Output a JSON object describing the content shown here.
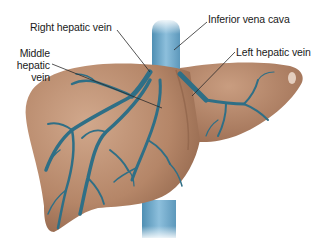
{
  "diagram": {
    "labels": [
      {
        "id": "right-hepatic-vein",
        "text": "Right hepatic vein"
      },
      {
        "id": "inferior-vena-cava",
        "text": "Inferior vena cava"
      },
      {
        "id": "middle-hepatic-vein",
        "lines": [
          "Middle",
          "hepatic",
          "vein"
        ]
      },
      {
        "id": "left-hepatic-vein",
        "text": "Left hepatic vein"
      }
    ],
    "colors": {
      "liver": "#b98a6c",
      "liver_shadow": "#8e6248",
      "liver_highlight": "#d3ad92",
      "vein": "#2f6f86",
      "vena_cava": "#6aa6c8",
      "leader_line": "#2a2a2a",
      "text": "#1a1a1a"
    }
  }
}
